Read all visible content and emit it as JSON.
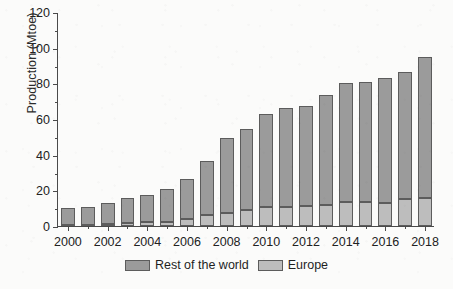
{
  "chart_data": {
    "type": "bar",
    "subtype": "stacked-vertical",
    "title": "",
    "xlabel": "",
    "ylabel": "Production (Mtoe)",
    "ylim": [
      0,
      120
    ],
    "y_ticks": [
      0,
      20,
      40,
      60,
      80,
      100,
      120
    ],
    "y_minor_ticks": [
      10,
      30,
      50,
      70,
      90,
      110
    ],
    "grid": false,
    "legend_position": "bottom-center",
    "categories": [
      "2000",
      "2001",
      "2002",
      "2003",
      "2004",
      "2005",
      "2006",
      "2007",
      "2008",
      "2009",
      "2010",
      "2011",
      "2012",
      "2013",
      "2014",
      "2015",
      "2016",
      "2017",
      "2018"
    ],
    "x_tick_labels": [
      "2000",
      "2002",
      "2004",
      "2006",
      "2008",
      "2010",
      "2012",
      "2014",
      "2016",
      "2018"
    ],
    "series": [
      {
        "name": "Europe",
        "color": "#bdbdbd",
        "values": [
          0.3,
          0.5,
          1.0,
          1.5,
          2.0,
          2.5,
          4.0,
          6.0,
          7.5,
          9.0,
          10.5,
          10.5,
          11.0,
          12.0,
          13.5,
          13.5,
          13.0,
          15.0,
          15.5
        ]
      },
      {
        "name": "Rest of the world",
        "color": "#9b9b9b",
        "values": [
          9.7,
          10.0,
          12.0,
          14.0,
          15.5,
          18.5,
          22.5,
          30.5,
          42.0,
          45.5,
          52.5,
          55.5,
          56.5,
          61.5,
          66.5,
          67.0,
          70.0,
          71.5,
          79.5
        ]
      }
    ],
    "totals": [
      10.0,
      10.5,
      13.0,
      15.5,
      17.5,
      21.0,
      26.5,
      36.5,
      49.5,
      54.5,
      63.0,
      66.0,
      67.5,
      73.5,
      80.0,
      80.5,
      83.0,
      86.5,
      95.0
    ]
  },
  "legend": {
    "entries": [
      {
        "label": "Rest of the world",
        "swatch": "rest"
      },
      {
        "label": "Europe",
        "swatch": "europe"
      }
    ]
  },
  "axis": {
    "y_title": "Production (Mtoe)"
  },
  "colors": {
    "rest_of_the_world": "#9b9b9b",
    "europe": "#bdbdbd",
    "axis": "#4a4a4a",
    "bar_outline": "#5c5c5c",
    "background": "#fbfbfa"
  }
}
